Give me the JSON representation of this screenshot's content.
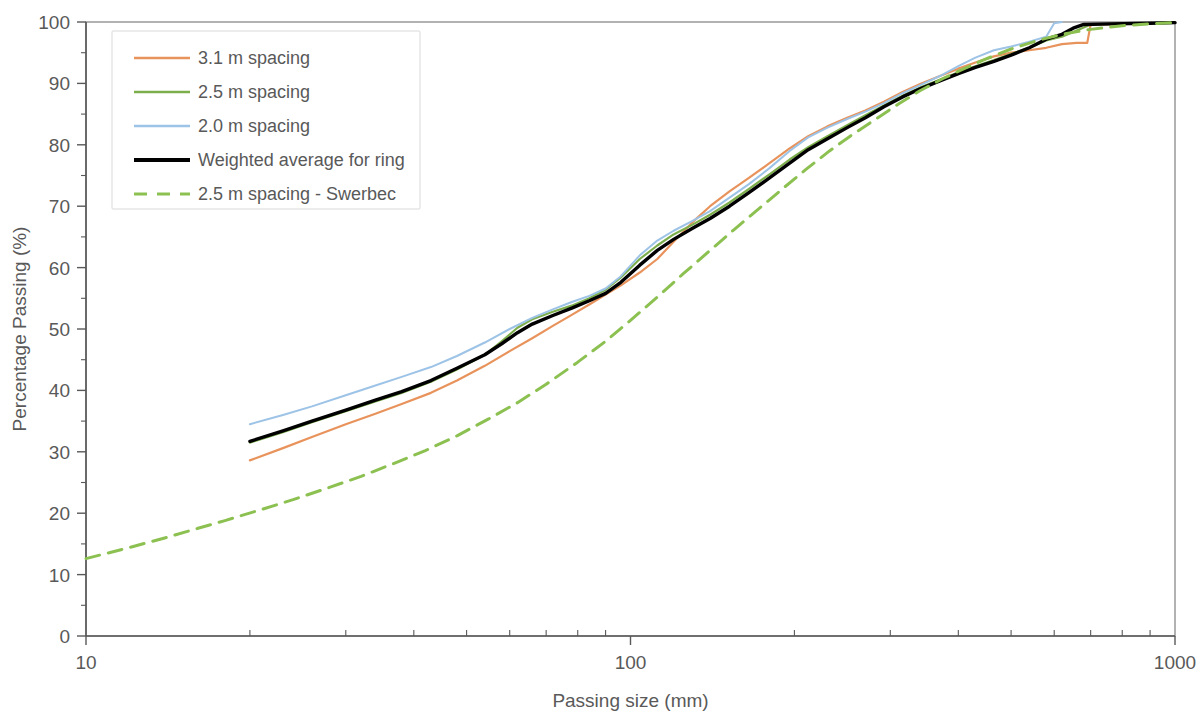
{
  "chart_data": {
    "type": "line",
    "title": "",
    "xlabel": "Passing size (mm)",
    "ylabel": "Percentage Passing (%)",
    "xscale": "log",
    "xlim": [
      10,
      1000
    ],
    "ylim": [
      0,
      100
    ],
    "grid": false,
    "legend_position": "top-left",
    "x_tick_labels": [
      "10",
      "100",
      "1000"
    ],
    "x_tick_values": [
      10,
      100,
      1000
    ],
    "y_tick_labels": [
      "0",
      "10",
      "20",
      "30",
      "40",
      "50",
      "60",
      "70",
      "80",
      "90",
      "100"
    ],
    "y_tick_values": [
      0,
      10,
      20,
      30,
      40,
      50,
      60,
      70,
      80,
      90,
      100
    ],
    "colors": {
      "spacing_3_1": "#E8935C",
      "spacing_2_5": "#7DAE4C",
      "spacing_2_0": "#9DC3E6",
      "weighted_average": "#000000",
      "swerbec": "#8CC152"
    },
    "series": [
      {
        "name": "3.1 m spacing",
        "color": "#E8935C",
        "style": "solid",
        "width": 2.2,
        "points": [
          [
            20.0,
            28.6
          ],
          [
            23.0,
            30.6
          ],
          [
            26.0,
            32.4
          ],
          [
            30.0,
            34.5
          ],
          [
            34.0,
            36.2
          ],
          [
            38.0,
            37.8
          ],
          [
            43.0,
            39.6
          ],
          [
            48.0,
            41.6
          ],
          [
            54.0,
            44.0
          ],
          [
            60.0,
            46.4
          ],
          [
            66.0,
            48.5
          ],
          [
            72.0,
            50.5
          ],
          [
            78.0,
            52.3
          ],
          [
            84.0,
            54.0
          ],
          [
            90.0,
            55.6
          ],
          [
            96.0,
            57.1
          ],
          [
            104.0,
            59.2
          ],
          [
            112.0,
            61.4
          ],
          [
            120.0,
            64.2
          ],
          [
            130.0,
            67.4
          ],
          [
            140.0,
            70.0
          ],
          [
            152.0,
            72.4
          ],
          [
            165.0,
            74.6
          ],
          [
            180.0,
            77.0
          ],
          [
            196.0,
            79.4
          ],
          [
            212.0,
            81.4
          ],
          [
            230.0,
            83.0
          ],
          [
            250.0,
            84.4
          ],
          [
            270.0,
            85.6
          ],
          [
            292.0,
            87.0
          ],
          [
            316.0,
            88.6
          ],
          [
            342.0,
            90.0
          ],
          [
            370.0,
            91.2
          ],
          [
            400.0,
            92.4
          ],
          [
            430.0,
            93.4
          ],
          [
            465.0,
            94.4
          ],
          [
            500.0,
            95.0
          ],
          [
            540.0,
            95.4
          ],
          [
            580.0,
            95.8
          ],
          [
            620.0,
            96.4
          ],
          [
            660.0,
            96.6
          ],
          [
            690.0,
            96.6
          ],
          [
            700.0,
            99.6
          ],
          [
            780.0,
            99.6
          ],
          [
            900.0,
            99.8
          ],
          [
            1000.0,
            99.9
          ]
        ]
      },
      {
        "name": "2.5 m spacing",
        "color": "#7DAE4C",
        "style": "solid",
        "width": 2.2,
        "points": [
          [
            20.0,
            31.5
          ],
          [
            23.0,
            33.2
          ],
          [
            26.0,
            34.8
          ],
          [
            30.0,
            36.6
          ],
          [
            34.0,
            38.2
          ],
          [
            38.0,
            39.6
          ],
          [
            43.0,
            41.4
          ],
          [
            48.0,
            43.4
          ],
          [
            54.0,
            45.8
          ],
          [
            58.0,
            48.0
          ],
          [
            62.0,
            50.2
          ],
          [
            66.0,
            51.6
          ],
          [
            72.0,
            52.8
          ],
          [
            78.0,
            53.8
          ],
          [
            84.0,
            55.0
          ],
          [
            90.0,
            56.4
          ],
          [
            96.0,
            58.4
          ],
          [
            104.0,
            61.4
          ],
          [
            112.0,
            63.6
          ],
          [
            120.0,
            65.4
          ],
          [
            130.0,
            67.0
          ],
          [
            140.0,
            68.6
          ],
          [
            152.0,
            70.6
          ],
          [
            165.0,
            72.8
          ],
          [
            180.0,
            75.2
          ],
          [
            196.0,
            77.6
          ],
          [
            212.0,
            79.6
          ],
          [
            230.0,
            81.4
          ],
          [
            250.0,
            83.2
          ],
          [
            270.0,
            84.8
          ],
          [
            292.0,
            86.4
          ],
          [
            316.0,
            88.0
          ],
          [
            342.0,
            89.4
          ],
          [
            370.0,
            90.6
          ],
          [
            400.0,
            91.8
          ],
          [
            430.0,
            92.8
          ],
          [
            465.0,
            93.8
          ],
          [
            500.0,
            94.8
          ],
          [
            540.0,
            95.8
          ],
          [
            580.0,
            97.0
          ],
          [
            620.0,
            97.6
          ],
          [
            660.0,
            98.6
          ],
          [
            700.0,
            99.6
          ],
          [
            780.0,
            99.7
          ],
          [
            900.0,
            99.8
          ],
          [
            1000.0,
            99.9
          ]
        ]
      },
      {
        "name": "2.0 m spacing",
        "color": "#9DC3E6",
        "style": "solid",
        "width": 2.0,
        "points": [
          [
            20.0,
            34.5
          ],
          [
            23.0,
            36.0
          ],
          [
            26.0,
            37.4
          ],
          [
            30.0,
            39.2
          ],
          [
            34.0,
            40.8
          ],
          [
            38.0,
            42.2
          ],
          [
            43.0,
            43.8
          ],
          [
            48.0,
            45.6
          ],
          [
            54.0,
            47.8
          ],
          [
            60.0,
            50.0
          ],
          [
            66.0,
            51.8
          ],
          [
            72.0,
            53.2
          ],
          [
            78.0,
            54.4
          ],
          [
            84.0,
            55.4
          ],
          [
            90.0,
            56.6
          ],
          [
            96.0,
            58.6
          ],
          [
            104.0,
            62.0
          ],
          [
            112.0,
            64.4
          ],
          [
            120.0,
            66.0
          ],
          [
            130.0,
            67.6
          ],
          [
            140.0,
            69.2
          ],
          [
            152.0,
            71.4
          ],
          [
            165.0,
            73.6
          ],
          [
            180.0,
            76.2
          ],
          [
            196.0,
            79.0
          ],
          [
            212.0,
            81.2
          ],
          [
            230.0,
            82.8
          ],
          [
            250.0,
            84.2
          ],
          [
            270.0,
            85.4
          ],
          [
            292.0,
            86.8
          ],
          [
            316.0,
            88.4
          ],
          [
            342.0,
            89.8
          ],
          [
            370.0,
            91.2
          ],
          [
            400.0,
            92.8
          ],
          [
            430.0,
            94.2
          ],
          [
            465.0,
            95.4
          ],
          [
            500.0,
            96.0
          ],
          [
            540.0,
            96.8
          ],
          [
            580.0,
            97.6
          ],
          [
            600.0,
            99.8
          ],
          [
            620.0,
            100.0
          ]
        ]
      },
      {
        "name": "Weighted average for ring",
        "color": "#000000",
        "style": "solid",
        "width": 3.4,
        "points": [
          [
            20.0,
            31.7
          ],
          [
            23.0,
            33.4
          ],
          [
            26.0,
            35.0
          ],
          [
            30.0,
            36.8
          ],
          [
            34.0,
            38.4
          ],
          [
            38.0,
            39.8
          ],
          [
            43.0,
            41.6
          ],
          [
            48.0,
            43.6
          ],
          [
            54.0,
            45.8
          ],
          [
            58.0,
            47.6
          ],
          [
            62.0,
            49.4
          ],
          [
            66.0,
            50.8
          ],
          [
            72.0,
            52.2
          ],
          [
            78.0,
            53.4
          ],
          [
            84.0,
            54.6
          ],
          [
            90.0,
            55.8
          ],
          [
            96.0,
            57.6
          ],
          [
            104.0,
            60.4
          ],
          [
            112.0,
            62.8
          ],
          [
            120.0,
            64.6
          ],
          [
            130.0,
            66.4
          ],
          [
            140.0,
            68.0
          ],
          [
            152.0,
            70.0
          ],
          [
            165.0,
            72.2
          ],
          [
            180.0,
            74.6
          ],
          [
            196.0,
            77.0
          ],
          [
            212.0,
            79.2
          ],
          [
            230.0,
            81.0
          ],
          [
            250.0,
            82.8
          ],
          [
            270.0,
            84.4
          ],
          [
            292.0,
            86.2
          ],
          [
            316.0,
            87.8
          ],
          [
            342.0,
            89.2
          ],
          [
            370.0,
            90.4
          ],
          [
            400.0,
            91.6
          ],
          [
            430.0,
            92.6
          ],
          [
            465.0,
            93.6
          ],
          [
            500.0,
            94.6
          ],
          [
            540.0,
            95.8
          ],
          [
            580.0,
            97.2
          ],
          [
            620.0,
            98.0
          ],
          [
            650.0,
            99.0
          ],
          [
            680.0,
            99.6
          ],
          [
            760.0,
            99.7
          ],
          [
            900.0,
            99.8
          ],
          [
            1000.0,
            99.9
          ]
        ]
      },
      {
        "name": "2.5 m spacing - Swerbec",
        "color": "#8CC152",
        "style": "dashed",
        "width": 3.0,
        "points": [
          [
            10.0,
            12.6
          ],
          [
            12.0,
            14.4
          ],
          [
            14.0,
            16.0
          ],
          [
            16.0,
            17.5
          ],
          [
            18.0,
            18.8
          ],
          [
            21.0,
            20.6
          ],
          [
            24.0,
            22.2
          ],
          [
            28.0,
            24.2
          ],
          [
            32.0,
            26.0
          ],
          [
            37.0,
            28.2
          ],
          [
            42.0,
            30.2
          ],
          [
            48.0,
            32.6
          ],
          [
            55.0,
            35.4
          ],
          [
            62.0,
            38.0
          ],
          [
            70.0,
            41.0
          ],
          [
            80.0,
            44.6
          ],
          [
            90.0,
            48.0
          ],
          [
            100.0,
            51.4
          ],
          [
            112.0,
            55.2
          ],
          [
            125.0,
            59.0
          ],
          [
            140.0,
            62.8
          ],
          [
            155.0,
            66.2
          ],
          [
            170.0,
            69.2
          ],
          [
            190.0,
            72.8
          ],
          [
            210.0,
            76.0
          ],
          [
            232.0,
            79.0
          ],
          [
            255.0,
            81.6
          ],
          [
            280.0,
            84.0
          ],
          [
            310.0,
            86.6
          ],
          [
            340.0,
            88.8
          ],
          [
            375.0,
            90.8
          ],
          [
            410.0,
            92.4
          ],
          [
            450.0,
            94.0
          ],
          [
            500.0,
            95.6
          ],
          [
            560.0,
            97.0
          ],
          [
            620.0,
            98.0
          ],
          [
            700.0,
            98.8
          ],
          [
            800.0,
            99.4
          ],
          [
            900.0,
            99.7
          ],
          [
            1000.0,
            99.9
          ]
        ]
      }
    ]
  },
  "legend": {
    "items": [
      {
        "label": "3.1 m spacing",
        "color": "#E8935C",
        "style": "solid",
        "width": 2.4
      },
      {
        "label": "2.5 m spacing",
        "color": "#7DAE4C",
        "style": "solid",
        "width": 2.4
      },
      {
        "label": "2.0 m spacing",
        "color": "#9DC3E6",
        "style": "solid",
        "width": 2.4
      },
      {
        "label": "Weighted average for ring",
        "color": "#000000",
        "style": "solid",
        "width": 4.0
      },
      {
        "label": "2.5 m spacing - Swerbec",
        "color": "#8CC152",
        "style": "dashed",
        "width": 3.2
      }
    ]
  },
  "axes": {
    "x_title": "Passing size (mm)",
    "y_title": "Percentage Passing (%)"
  }
}
